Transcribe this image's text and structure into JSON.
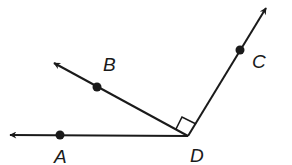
{
  "diagram": {
    "type": "geometry-angles",
    "vertex": {
      "label": "D",
      "x": 188,
      "y": 136
    },
    "rays": [
      {
        "name": "DA",
        "point_label": "A",
        "point": {
          "x": 60,
          "y": 135
        },
        "tip": {
          "x": 8,
          "y": 135
        }
      },
      {
        "name": "DB",
        "point_label": "B",
        "point": {
          "x": 97,
          "y": 87
        },
        "tip": {
          "x": 52,
          "y": 62
        }
      },
      {
        "name": "DC",
        "point_label": "C",
        "point": {
          "x": 240,
          "y": 50
        },
        "tip": {
          "x": 267,
          "y": 6
        }
      }
    ],
    "right_angle": {
      "between": [
        "DB",
        "DC"
      ]
    },
    "labels": {
      "A": "A",
      "B": "B",
      "C": "C",
      "D": "D"
    },
    "colors": {
      "line": "#1a1a1a",
      "background": "#ffffff"
    }
  }
}
